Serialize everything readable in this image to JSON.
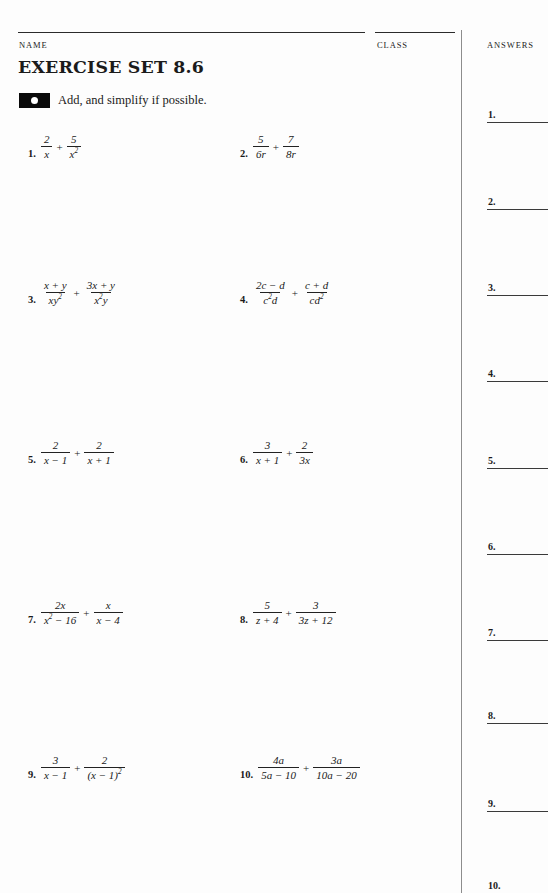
{
  "header": {
    "name_label": "NAME",
    "class_label": "CLASS",
    "answers_label": "ANSWERS"
  },
  "title": "EXERCISE SET 8.6",
  "instruction": {
    "marker_icon": "filled-rect-dot-icon",
    "text": "Add, and simplify if possible."
  },
  "problems": [
    {
      "number": "1.",
      "terms": [
        {
          "num": "2",
          "den": "x"
        },
        {
          "num": "5",
          "den": "x²"
        }
      ],
      "operator": "+",
      "expression": "2/x + 5/x^2"
    },
    {
      "number": "2.",
      "terms": [
        {
          "num": "5",
          "den": "6r"
        },
        {
          "num": "7",
          "den": "8r"
        }
      ],
      "operator": "+",
      "expression": "5/(6r) + 7/(8r)"
    },
    {
      "number": "3.",
      "terms": [
        {
          "num": "x + y",
          "den": "xy²"
        },
        {
          "num": "3x + y",
          "den": "x²y"
        }
      ],
      "operator": "+",
      "expression": "(x+y)/(xy^2) + (3x+y)/(x^2 y)"
    },
    {
      "number": "4.",
      "terms": [
        {
          "num": "2c − d",
          "den": "c²d"
        },
        {
          "num": "c + d",
          "den": "cd²"
        }
      ],
      "operator": "+",
      "expression": "(2c-d)/(c^2 d) + (c+d)/(cd^2)"
    },
    {
      "number": "5.",
      "terms": [
        {
          "num": "2",
          "den": "x − 1"
        },
        {
          "num": "2",
          "den": "x + 1"
        }
      ],
      "operator": "+",
      "expression": "2/(x-1) + 2/(x+1)"
    },
    {
      "number": "6.",
      "terms": [
        {
          "num": "3",
          "den": "x + 1"
        },
        {
          "num": "2",
          "den": "3x"
        }
      ],
      "operator": "+",
      "expression": "3/(x+1) + 2/(3x)"
    },
    {
      "number": "7.",
      "terms": [
        {
          "num": "2x",
          "den": "x² − 16"
        },
        {
          "num": "x",
          "den": "x − 4"
        }
      ],
      "operator": "+",
      "expression": "2x/(x^2-16) + x/(x-4)"
    },
    {
      "number": "8.",
      "terms": [
        {
          "num": "5",
          "den": "z + 4"
        },
        {
          "num": "3",
          "den": "3z + 12"
        }
      ],
      "operator": "+",
      "expression": "5/(z+4) + 3/(3z+12)"
    },
    {
      "number": "9.",
      "terms": [
        {
          "num": "3",
          "den": "x − 1"
        },
        {
          "num": "2",
          "den": "(x − 1)²"
        }
      ],
      "operator": "+",
      "expression": "3/(x-1) + 2/(x-1)^2"
    },
    {
      "number": "10.",
      "terms": [
        {
          "num": "4a",
          "den": "5a − 10"
        },
        {
          "num": "3a",
          "den": "10a − 20"
        }
      ],
      "operator": "+",
      "expression": "4a/(5a-10) + 3a/(10a-20)"
    }
  ],
  "answer_blanks": [
    {
      "number": "1."
    },
    {
      "number": "2."
    },
    {
      "number": "3."
    },
    {
      "number": "4."
    },
    {
      "number": "5."
    },
    {
      "number": "6."
    },
    {
      "number": "7."
    },
    {
      "number": "8."
    },
    {
      "number": "9."
    },
    {
      "number": "10."
    }
  ],
  "colors": {
    "ink": "#1a1a1a",
    "rule": "#2b2b2b",
    "divider": "#8d8d8d",
    "page": "#fdfdfd",
    "marker": "#0a0a0a"
  }
}
